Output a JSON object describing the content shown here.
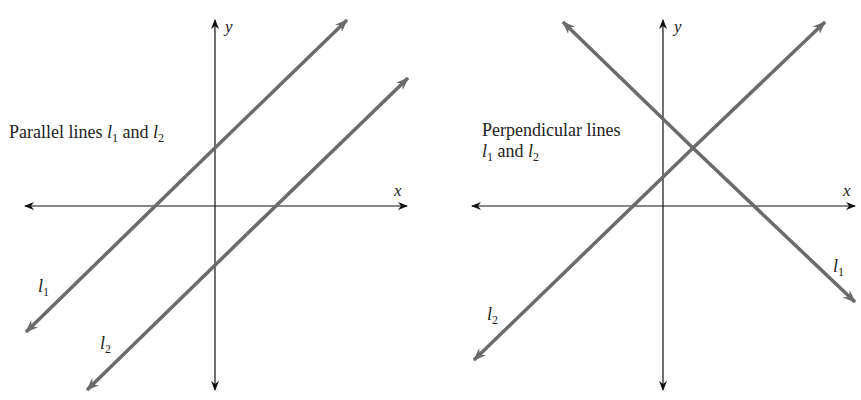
{
  "colors": {
    "axis": "#111111",
    "line": "#6b6b6b",
    "text": "#222222",
    "background": "#ffffff"
  },
  "left_panel": {
    "caption_prefix": "Parallel lines ",
    "l1": "l",
    "l1_sub": "1",
    "and": " and ",
    "l2": "l",
    "l2_sub": "2",
    "axis_x": "x",
    "axis_y": "y",
    "line_label_1": "l",
    "line_label_1_sub": "1",
    "line_label_2": "l",
    "line_label_2_sub": "2"
  },
  "right_panel": {
    "caption_line1": "Perpendicular lines",
    "l1": "l",
    "l1_sub": "1",
    "and": " and ",
    "l2": "l",
    "l2_sub": "2",
    "axis_x": "x",
    "axis_y": "y",
    "line_label_1": "l",
    "line_label_1_sub": "1",
    "line_label_2": "l",
    "line_label_2_sub": "2"
  }
}
